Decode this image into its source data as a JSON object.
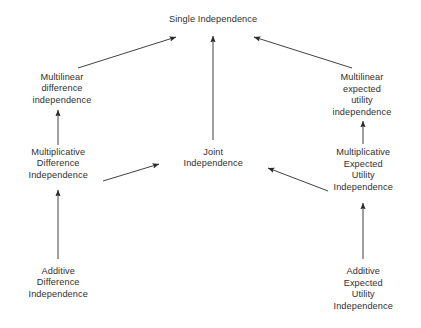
{
  "diagram": {
    "title_node": "single-independence",
    "background_color": "#ffffff",
    "line_color": "#2b2b2b",
    "text_color": "#2f2f2f",
    "nodes": [
      {
        "id": "single-independence",
        "label": "Single Independence",
        "lines": [
          "Single Independence"
        ],
        "x": 213,
        "y": 20
      },
      {
        "id": "multilinear-difference-independence",
        "label": "Multilinear difference independence",
        "lines": [
          "Multilinear",
          "difference",
          "independence"
        ],
        "x": 62,
        "y": 89
      },
      {
        "id": "multilinear-expected-utility-independence",
        "label": "Multilinear expected utility independence",
        "lines": [
          "Multilinear",
          "expected",
          "utility",
          "independence"
        ],
        "x": 362,
        "y": 95
      },
      {
        "id": "multiplicative-difference-independence",
        "label": "Multiplicative Difference Independence",
        "lines": [
          "Multiplicative",
          "Difference",
          "Independence"
        ],
        "x": 58,
        "y": 164
      },
      {
        "id": "joint-independence",
        "label": "Joint Independence",
        "lines": [
          "Joint",
          "Independence"
        ],
        "x": 213,
        "y": 158
      },
      {
        "id": "multiplicative-expected-utility-independence",
        "label": "Multiplicative Expected Utility Independence",
        "lines": [
          "Multiplicative",
          "Expected",
          "Utility",
          "Independence"
        ],
        "x": 363,
        "y": 170
      },
      {
        "id": "additive-difference-independence",
        "label": "Additive Difference Independence",
        "lines": [
          "Additive",
          "Difference",
          "Independence"
        ],
        "x": 58,
        "y": 283
      },
      {
        "id": "additive-expected-utility-independence",
        "label": "Additive Expected Utility Independence",
        "lines": [
          "Additive",
          "Expected",
          "Utility",
          "Independence"
        ],
        "x": 363,
        "y": 289
      }
    ],
    "edges": [
      {
        "id": "edge-multilinear-difference-to-single",
        "from": "multilinear-difference-independence",
        "to": "single-independence",
        "x1": 78,
        "y1": 68,
        "x2": 176,
        "y2": 37
      },
      {
        "id": "edge-joint-to-single",
        "from": "joint-independence",
        "to": "single-independence",
        "x1": 213,
        "y1": 140,
        "x2": 213,
        "y2": 36
      },
      {
        "id": "edge-multilinear-expected-utility-to-single",
        "from": "multilinear-expected-utility-independence",
        "to": "single-independence",
        "x1": 352,
        "y1": 68,
        "x2": 254,
        "y2": 37
      },
      {
        "id": "edge-multiplicative-difference-to-multilinear-difference",
        "from": "multiplicative-difference-independence",
        "to": "multilinear-difference-independence",
        "x1": 58,
        "y1": 145,
        "x2": 58,
        "y2": 110
      },
      {
        "id": "edge-multiplicative-expected-utility-to-multilinear-expected-utility",
        "from": "multiplicative-expected-utility-independence",
        "to": "multilinear-expected-utility-independence",
        "x1": 363,
        "y1": 144,
        "x2": 363,
        "y2": 121
      },
      {
        "id": "edge-multiplicative-difference-to-joint",
        "from": "multiplicative-difference-independence",
        "to": "joint-independence",
        "x1": 103,
        "y1": 181,
        "x2": 159,
        "y2": 164
      },
      {
        "id": "edge-multiplicative-expected-utility-to-joint",
        "from": "multiplicative-expected-utility-independence",
        "to": "joint-independence",
        "x1": 328,
        "y1": 191,
        "x2": 268,
        "y2": 168
      },
      {
        "id": "edge-additive-difference-to-multiplicative-difference",
        "from": "additive-difference-independence",
        "to": "multiplicative-difference-independence",
        "x1": 58,
        "y1": 259,
        "x2": 58,
        "y2": 190
      },
      {
        "id": "edge-additive-expected-utility-to-multiplicative-expected-utility",
        "from": "additive-expected-utility-independence",
        "to": "multiplicative-expected-utility-independence",
        "x1": 363,
        "y1": 259,
        "x2": 363,
        "y2": 203
      }
    ]
  }
}
